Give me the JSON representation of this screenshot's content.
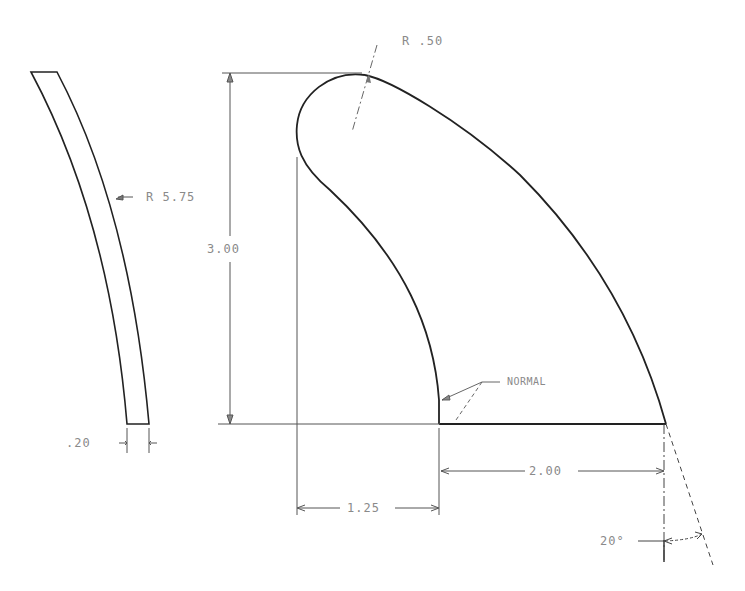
{
  "drawing": {
    "title": "Fin profile and side view",
    "colors": {
      "outline": "#222222",
      "dimension": "#555555",
      "text": "#8a8a8a",
      "background": "#ffffff"
    },
    "side_view": {
      "radius_label": "R 5.75",
      "thickness_label": ".20"
    },
    "profile_view": {
      "tip_radius_label": "R .50",
      "height_label": "3.00",
      "normal_label": "NORMAL",
      "rake_offset_label": "1.25",
      "base_length_label": "2.00",
      "angle_label": "20°"
    }
  }
}
